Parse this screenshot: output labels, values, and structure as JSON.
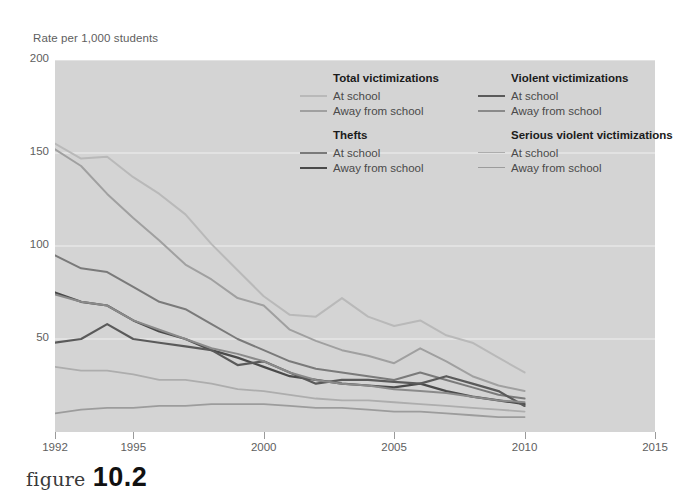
{
  "figure": {
    "caption_word": "figure",
    "caption_number": "10.2"
  },
  "chart_data": {
    "type": "line",
    "title": "",
    "subtitle": "",
    "ylabel": "Rate per 1,000 students",
    "xlabel": "",
    "ylim": [
      0,
      200
    ],
    "xlim": [
      1992,
      2015
    ],
    "yticks": [
      50,
      100,
      150,
      200
    ],
    "ytick_labels": [
      "50",
      "100",
      "150",
      "200"
    ],
    "xticks": [
      1992,
      1995,
      2000,
      2005,
      2010,
      2015
    ],
    "xtick_labels": [
      "1992",
      "1995",
      "2000",
      "2005",
      "2010",
      "2015"
    ],
    "grid": true,
    "grid_axis": "y",
    "legend_position": "upper-right-inside",
    "plot_background": "#d4d4d4",
    "gridline_color": "#f0f0f0",
    "x": [
      1992,
      1993,
      1994,
      1995,
      1996,
      1997,
      1998,
      1999,
      2000,
      2001,
      2002,
      2003,
      2004,
      2005,
      2006,
      2007,
      2008,
      2009,
      2010
    ],
    "series": [
      {
        "name": "Total victimizations — At school",
        "group": "Total victimizations",
        "location": "At school",
        "color": "#b9b9b9",
        "width": 2.0,
        "values": [
          155,
          147,
          148,
          137,
          128,
          117,
          101,
          87,
          73,
          63,
          62,
          72,
          62,
          57,
          60,
          52,
          48,
          40,
          32
        ]
      },
      {
        "name": "Total victimizations — Away from school",
        "group": "Total victimizations",
        "location": "Away from school",
        "color": "#a0a0a0",
        "width": 2.0,
        "values": [
          152,
          143,
          128,
          115,
          103,
          90,
          82,
          72,
          68,
          55,
          49,
          44,
          41,
          37,
          45,
          38,
          30,
          25,
          22
        ]
      },
      {
        "name": "Thefts — At school",
        "group": "Thefts",
        "location": "At school",
        "color": "#7a7a7a",
        "width": 2.0,
        "values": [
          95,
          88,
          86,
          78,
          70,
          66,
          58,
          50,
          44,
          38,
          34,
          32,
          30,
          28,
          32,
          28,
          24,
          20,
          18
        ]
      },
      {
        "name": "Thefts — Away from school",
        "group": "Thefts",
        "location": "Away from school",
        "color": "#4a4a4a",
        "width": 2.2,
        "values": [
          75,
          70,
          68,
          60,
          54,
          50,
          44,
          40,
          35,
          30,
          28,
          26,
          25,
          24,
          26,
          22,
          19,
          17,
          15
        ]
      },
      {
        "name": "Violent victimizations — At school",
        "group": "Violent victimizations",
        "location": "At school",
        "color": "#5a5a5a",
        "width": 2.2,
        "values": [
          48,
          50,
          58,
          50,
          48,
          46,
          44,
          36,
          38,
          32,
          26,
          28,
          28,
          27,
          26,
          30,
          26,
          22,
          14
        ]
      },
      {
        "name": "Violent victimizations — Away from school",
        "group": "Violent victimizations",
        "location": "Away from school",
        "color": "#8a8a8a",
        "width": 2.0,
        "values": [
          74,
          70,
          68,
          60,
          55,
          50,
          45,
          42,
          38,
          32,
          28,
          26,
          25,
          23,
          22,
          21,
          19,
          17,
          16
        ]
      },
      {
        "name": "Serious violent victimizations — At school",
        "group": "Serious violent victimizations",
        "location": "At school",
        "color": "#adadad",
        "width": 1.8,
        "values": [
          35,
          33,
          33,
          31,
          28,
          28,
          26,
          23,
          22,
          20,
          18,
          17,
          17,
          16,
          15,
          14,
          13,
          12,
          11
        ]
      },
      {
        "name": "Serious violent victimizations — Away from school",
        "group": "Serious violent victimizations",
        "location": "Away from school",
        "color": "#9c9c9c",
        "width": 1.8,
        "values": [
          10,
          12,
          13,
          13,
          14,
          14,
          15,
          15,
          15,
          14,
          13,
          13,
          12,
          11,
          11,
          10,
          9,
          8,
          8
        ]
      }
    ]
  },
  "legend": {
    "columns": [
      {
        "groups": [
          {
            "heading": "Total victimizations",
            "items": [
              {
                "label": "At school",
                "color": "#b9b9b9",
                "width": 2.0
              },
              {
                "label": "Away from school",
                "color": "#a0a0a0",
                "width": 2.0
              }
            ]
          },
          {
            "heading": "Thefts",
            "items": [
              {
                "label": "At school",
                "color": "#7a7a7a",
                "width": 2.0
              },
              {
                "label": "Away from school",
                "color": "#4a4a4a",
                "width": 2.4
              }
            ]
          }
        ]
      },
      {
        "groups": [
          {
            "heading": "Violent victimizations",
            "items": [
              {
                "label": "At school",
                "color": "#5a5a5a",
                "width": 2.4
              },
              {
                "label": "Away from school",
                "color": "#8a8a8a",
                "width": 2.0
              }
            ]
          },
          {
            "heading": "Serious violent victimizations",
            "items": [
              {
                "label": "At school",
                "color": "#adadad",
                "width": 1.8
              },
              {
                "label": "Away from school",
                "color": "#9c9c9c",
                "width": 1.8
              }
            ]
          }
        ]
      }
    ]
  }
}
